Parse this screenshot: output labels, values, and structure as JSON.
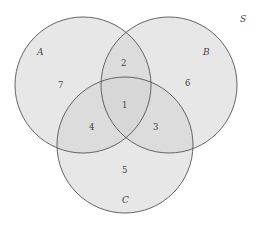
{
  "diagram": {
    "type": "venn-3",
    "universe_label": "S",
    "sets": [
      {
        "label": "A",
        "cx": 83,
        "cy": 85,
        "r": 68
      },
      {
        "label": "B",
        "cx": 169,
        "cy": 85,
        "r": 68
      },
      {
        "label": "C",
        "cx": 125,
        "cy": 145,
        "r": 68
      }
    ],
    "regions": [
      {
        "id": "A_only",
        "number": "7"
      },
      {
        "id": "A_and_B_only",
        "number": "2"
      },
      {
        "id": "B_only",
        "number": "6"
      },
      {
        "id": "A_and_B_and_C",
        "number": "1"
      },
      {
        "id": "A_and_C_only",
        "number": "4"
      },
      {
        "id": "B_and_C_only",
        "number": "3"
      },
      {
        "id": "C_only",
        "number": "5"
      }
    ],
    "colors": {
      "background": "#ffffff",
      "fill": "#d9d9d9",
      "fill_opacity": 0.55,
      "stroke": "#555555"
    }
  }
}
